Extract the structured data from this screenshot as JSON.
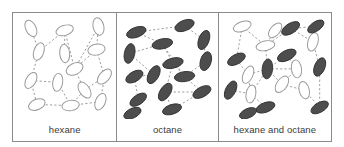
{
  "figure": {
    "type": "molecular-packing-diagram",
    "background_color": "#ffffff",
    "frame_color": "#8a8a8a",
    "bond_color": "#9a9a9a",
    "hexane_fill": "#ffffff",
    "hexane_stroke": "#9a9a9a",
    "octane_fill": "#4d4d4d",
    "octane_stroke": "#2f2f2f",
    "label_color": "#3a3a3a"
  },
  "panels": [
    {
      "id": "hexane",
      "label": "hexane",
      "legend": "open ellipses represent hexane molecules",
      "molecule_counts": {
        "hexane": 14,
        "octane": 0
      },
      "molecules": [
        {
          "type": "hexane",
          "cx": 18,
          "cy": 16,
          "rx": 5.2,
          "ry": 9.0,
          "angle": -25
        },
        {
          "type": "hexane",
          "cx": 52,
          "cy": 18,
          "rx": 5.2,
          "ry": 9.0,
          "angle": 72
        },
        {
          "type": "hexane",
          "cx": 86,
          "cy": 14,
          "rx": 5.4,
          "ry": 9.2,
          "angle": -12
        },
        {
          "type": "hexane",
          "cx": 26,
          "cy": 40,
          "rx": 5.0,
          "ry": 9.4,
          "angle": 18
        },
        {
          "type": "hexane",
          "cx": 52,
          "cy": 42,
          "rx": 5.0,
          "ry": 9.6,
          "angle": -5
        },
        {
          "type": "hexane",
          "cx": 84,
          "cy": 38,
          "rx": 5.6,
          "ry": 8.8,
          "angle": 78
        },
        {
          "type": "hexane",
          "cx": 62,
          "cy": 58,
          "rx": 5.8,
          "ry": 9.0,
          "angle": 62
        },
        {
          "type": "hexane",
          "cx": 18,
          "cy": 70,
          "rx": 5.0,
          "ry": 9.0,
          "angle": 28
        },
        {
          "type": "hexane",
          "cx": 45,
          "cy": 72,
          "rx": 5.0,
          "ry": 9.4,
          "angle": 8
        },
        {
          "type": "hexane",
          "cx": 92,
          "cy": 66,
          "rx": 5.2,
          "ry": 9.2,
          "angle": 40
        },
        {
          "type": "hexane",
          "cx": 72,
          "cy": 80,
          "rx": 5.2,
          "ry": 9.2,
          "angle": -32
        },
        {
          "type": "hexane",
          "cx": 24,
          "cy": 95,
          "rx": 5.4,
          "ry": 8.8,
          "angle": 66
        },
        {
          "type": "hexane",
          "cx": 58,
          "cy": 96,
          "rx": 5.4,
          "ry": 8.8,
          "angle": 80
        },
        {
          "type": "hexane",
          "cx": 88,
          "cy": 92,
          "rx": 5.0,
          "ry": 9.0,
          "angle": 22
        }
      ],
      "bonds": [
        [
          0,
          3
        ],
        [
          1,
          4
        ],
        [
          2,
          5
        ],
        [
          3,
          1
        ],
        [
          1,
          6
        ],
        [
          2,
          6
        ],
        [
          3,
          7
        ],
        [
          6,
          5
        ],
        [
          5,
          9
        ],
        [
          6,
          10
        ],
        [
          7,
          8
        ],
        [
          8,
          12
        ],
        [
          7,
          11
        ],
        [
          11,
          12
        ],
        [
          12,
          10
        ],
        [
          10,
          9
        ],
        [
          9,
          13
        ],
        [
          13,
          12
        ]
      ]
    },
    {
      "id": "octane",
      "label": "octane",
      "legend": "filled ellipses represent octane molecules",
      "molecule_counts": {
        "hexane": 0,
        "octane": 15
      },
      "molecules": [
        {
          "type": "octane",
          "cx": 20,
          "cy": 20,
          "rx": 10.5,
          "ry": 5.2,
          "angle": -20
        },
        {
          "type": "octane",
          "cx": 70,
          "cy": 13,
          "rx": 10.5,
          "ry": 5.4,
          "angle": -22
        },
        {
          "type": "octane",
          "cx": 47,
          "cy": 32,
          "rx": 10.8,
          "ry": 5.2,
          "angle": -12
        },
        {
          "type": "octane",
          "cx": 90,
          "cy": 28,
          "rx": 5.4,
          "ry": 10.4,
          "angle": 20
        },
        {
          "type": "octane",
          "cx": 13,
          "cy": 42,
          "rx": 5.4,
          "ry": 10.4,
          "angle": 12
        },
        {
          "type": "octane",
          "cx": 58,
          "cy": 52,
          "rx": 10.8,
          "ry": 5.2,
          "angle": -14
        },
        {
          "type": "octane",
          "cx": 92,
          "cy": 50,
          "rx": 5.6,
          "ry": 10.0,
          "angle": 16
        },
        {
          "type": "octane",
          "cx": 18,
          "cy": 66,
          "rx": 9.8,
          "ry": 5.2,
          "angle": -30
        },
        {
          "type": "octane",
          "cx": 38,
          "cy": 64,
          "rx": 5.4,
          "ry": 10.2,
          "angle": 28
        },
        {
          "type": "octane",
          "cx": 70,
          "cy": 66,
          "rx": 10.6,
          "ry": 5.2,
          "angle": -8
        },
        {
          "type": "octane",
          "cx": 50,
          "cy": 82,
          "rx": 5.4,
          "ry": 10.2,
          "angle": 32
        },
        {
          "type": "octane",
          "cx": 88,
          "cy": 82,
          "rx": 10.2,
          "ry": 5.2,
          "angle": -28
        },
        {
          "type": "octane",
          "cx": 22,
          "cy": 90,
          "rx": 9.8,
          "ry": 5.0,
          "angle": -34
        },
        {
          "type": "octane",
          "cx": 57,
          "cy": 100,
          "rx": 10.2,
          "ry": 5.0,
          "angle": -18
        },
        {
          "type": "octane",
          "cx": 16,
          "cy": 104,
          "rx": 9.6,
          "ry": 5.0,
          "angle": -26
        }
      ],
      "bonds": [
        [
          0,
          1
        ],
        [
          1,
          3
        ],
        [
          3,
          6
        ],
        [
          0,
          2
        ],
        [
          2,
          5
        ],
        [
          4,
          2
        ],
        [
          4,
          8
        ],
        [
          8,
          7
        ],
        [
          5,
          9
        ],
        [
          9,
          6
        ],
        [
          9,
          11
        ],
        [
          5,
          10
        ],
        [
          10,
          11
        ],
        [
          7,
          12
        ],
        [
          12,
          14
        ],
        [
          10,
          13
        ],
        [
          13,
          11
        ],
        [
          2,
          9
        ]
      ]
    },
    {
      "id": "mixture",
      "label": "hexane and octane",
      "legend": "mixture of open hexane and filled octane molecules",
      "molecule_counts": {
        "hexane": 9,
        "octane": 10
      },
      "molecules": [
        {
          "type": "hexane",
          "cx": 24,
          "cy": 14,
          "rx": 9.6,
          "ry": 5.0,
          "angle": -20
        },
        {
          "type": "octane",
          "cx": 74,
          "cy": 16,
          "rx": 10.4,
          "ry": 5.2,
          "angle": -32
        },
        {
          "type": "hexane",
          "cx": 48,
          "cy": 34,
          "rx": 9.8,
          "ry": 5.0,
          "angle": -12
        },
        {
          "type": "hexane",
          "cx": 97,
          "cy": 30,
          "rx": 5.2,
          "ry": 9.8,
          "angle": 16
        },
        {
          "type": "octane",
          "cx": 70,
          "cy": 44,
          "rx": 10.4,
          "ry": 5.2,
          "angle": -26
        },
        {
          "type": "octane",
          "cx": 18,
          "cy": 48,
          "rx": 10.0,
          "ry": 5.0,
          "angle": -28
        },
        {
          "type": "octane",
          "cx": 50,
          "cy": 58,
          "rx": 5.4,
          "ry": 10.4,
          "angle": 6
        },
        {
          "type": "hexane",
          "cx": 30,
          "cy": 64,
          "rx": 5.0,
          "ry": 9.6,
          "angle": 24
        },
        {
          "type": "hexane",
          "cx": 80,
          "cy": 58,
          "rx": 5.2,
          "ry": 9.4,
          "angle": -8
        },
        {
          "type": "octane",
          "cx": 104,
          "cy": 56,
          "rx": 5.4,
          "ry": 10.0,
          "angle": 22
        },
        {
          "type": "hexane",
          "cx": 65,
          "cy": 74,
          "rx": 5.4,
          "ry": 9.6,
          "angle": 34
        },
        {
          "type": "octane",
          "cx": 12,
          "cy": 80,
          "rx": 5.2,
          "ry": 10.2,
          "angle": 26
        },
        {
          "type": "hexane",
          "cx": 33,
          "cy": 84,
          "rx": 5.0,
          "ry": 9.4,
          "angle": 10
        },
        {
          "type": "hexane",
          "cx": 88,
          "cy": 80,
          "rx": 5.2,
          "ry": 9.2,
          "angle": -14
        },
        {
          "type": "octane",
          "cx": 48,
          "cy": 98,
          "rx": 10.2,
          "ry": 5.0,
          "angle": -20
        },
        {
          "type": "octane",
          "cx": 104,
          "cy": 98,
          "rx": 10.0,
          "ry": 5.0,
          "angle": -30
        },
        {
          "type": "hexane",
          "cx": 58,
          "cy": 18,
          "rx": 5.0,
          "ry": 9.0,
          "angle": 40
        },
        {
          "type": "octane",
          "cx": 100,
          "cy": 14,
          "rx": 9.6,
          "ry": 4.8,
          "angle": -34
        },
        {
          "type": "octane",
          "cx": 30,
          "cy": 104,
          "rx": 9.4,
          "ry": 4.8,
          "angle": -24
        }
      ],
      "bonds": [
        [
          0,
          2
        ],
        [
          0,
          5
        ],
        [
          2,
          1
        ],
        [
          1,
          3
        ],
        [
          3,
          9
        ],
        [
          2,
          6
        ],
        [
          6,
          4
        ],
        [
          4,
          8
        ],
        [
          6,
          8
        ],
        [
          6,
          7
        ],
        [
          7,
          5
        ],
        [
          6,
          10
        ],
        [
          6,
          12
        ],
        [
          10,
          13
        ],
        [
          8,
          10
        ],
        [
          12,
          14
        ],
        [
          7,
          12
        ],
        [
          11,
          12
        ],
        [
          9,
          15
        ],
        [
          13,
          15
        ],
        [
          16,
          2
        ],
        [
          1,
          17
        ]
      ]
    }
  ]
}
